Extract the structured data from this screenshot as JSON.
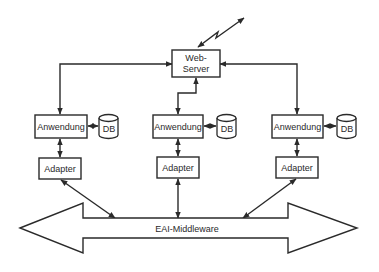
{
  "diagram": {
    "web_server": {
      "line1": "Web-",
      "line2": "Server"
    },
    "applications": [
      {
        "label": "Anwendung",
        "db": "DB",
        "adapter": "Adapter"
      },
      {
        "label": "Anwendung",
        "db": "DB",
        "adapter": "Adapter"
      },
      {
        "label": "Anwendung",
        "db": "DB",
        "adapter": "Adapter"
      }
    ],
    "middleware": {
      "label": "EAI-Middleware"
    },
    "colors": {
      "stroke": "#2a2a2a",
      "background": "#ffffff"
    }
  }
}
